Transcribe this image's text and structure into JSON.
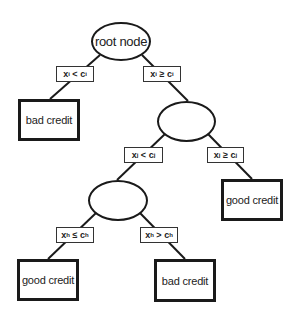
{
  "diagram": {
    "type": "decision-tree",
    "nodes": {
      "root": {
        "label": "root node"
      },
      "split_j": {
        "label": ""
      },
      "split_h": {
        "label": ""
      },
      "leaf_left_top": {
        "label": "bad credit"
      },
      "leaf_right_mid": {
        "label": "good credit"
      },
      "leaf_bottom_left": {
        "label": "good credit"
      },
      "leaf_bottom_right": {
        "label": "bad credit"
      }
    },
    "conditions": {
      "root_left": {
        "var": "x",
        "var_sub": "i",
        "op": "<",
        "const": "c",
        "const_sub": "i"
      },
      "root_right": {
        "var": "x",
        "var_sub": "i",
        "op": "≥",
        "const": "c",
        "const_sub": "i"
      },
      "j_left": {
        "var": "x",
        "var_sub": "j",
        "op": "<",
        "const": "c",
        "const_sub": "j"
      },
      "j_right": {
        "var": "x",
        "var_sub": "j",
        "op": "≥",
        "const": "c",
        "const_sub": "j"
      },
      "h_left": {
        "var": "x",
        "var_sub": "h",
        "op": "≤",
        "const": "c",
        "const_sub": "h"
      },
      "h_right": {
        "var": "x",
        "var_sub": "h",
        "op": ">",
        "const": "c",
        "const_sub": "h"
      }
    },
    "edges": [
      [
        "root",
        "leaf_left_top",
        "root_left"
      ],
      [
        "root",
        "split_j",
        "root_right"
      ],
      [
        "split_j",
        "split_h",
        "j_left"
      ],
      [
        "split_j",
        "leaf_right_mid",
        "j_right"
      ],
      [
        "split_h",
        "leaf_bottom_left",
        "h_left"
      ],
      [
        "split_h",
        "leaf_bottom_right",
        "h_right"
      ]
    ]
  }
}
